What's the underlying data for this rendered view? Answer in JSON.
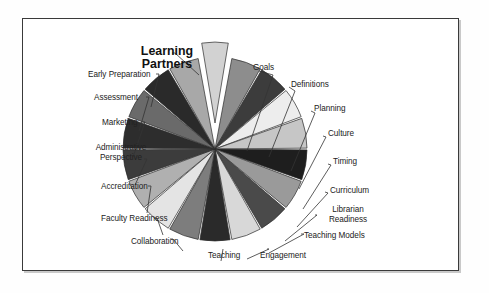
{
  "figure": {
    "title": "Learning Partners",
    "frame_border_color": "#3a3a3a",
    "background_color": "#ffffff"
  },
  "chart_data": {
    "type": "pie",
    "title": "Learning Partners",
    "xlabel": "",
    "ylabel": "",
    "grid": false,
    "legend": "none (direct labels with leader lines)",
    "note": "17 equal slices; the 'Learning Partners' slice is exploded away from the pie toward the upper-left.",
    "labels": [
      "Learning Partners",
      "Goals",
      "Definitions",
      "Planning",
      "Culture",
      "Timing",
      "Curriculum",
      "Librarian Readiness",
      "Teaching Models",
      "Engagement",
      "Teaching",
      "Collaboration",
      "Faculty Readiness",
      "Accreditation",
      "Administrative Perspective",
      "Marketing",
      "Assessment",
      "Early Preparation"
    ],
    "values": [
      1,
      1,
      1,
      1,
      1,
      1,
      1,
      1,
      1,
      1,
      1,
      1,
      1,
      1,
      1,
      1,
      1,
      1
    ],
    "slice_colors": [
      "#d2d2d2",
      "#8d8d8d",
      "#3c3c3c",
      "#ededed",
      "#c6c6c6",
      "#1e1e1e",
      "#9a9a9a",
      "#4a4a4a",
      "#d8d8d8",
      "#2a2a2a",
      "#7d7d7d",
      "#e4e4e4",
      "#b0b0b0",
      "#3c3c3c",
      "#2d2d2d",
      "#6a6a6a",
      "#2a2a2a",
      "#a8a8a8"
    ],
    "exploded_slice": "Learning Partners"
  },
  "labels": {
    "learning_partners": "Learning Partners",
    "goals": "Goals",
    "definitions": "Definitions",
    "planning": "Planning",
    "culture": "Culture",
    "timing": "Timing",
    "curriculum": "Curriculum",
    "librarian_readiness": "Librarian Readiness",
    "teaching_models": "Teaching Models",
    "engagement": "Engagement",
    "teaching": "Teaching",
    "collaboration": "Collaboration",
    "faculty_readiness": "Faculty Readiness",
    "accreditation": "Accreditation",
    "administrative_perspective": "Administrative Perspective",
    "marketing": "Marketing",
    "assessment": "Assessment",
    "early_preparation": "Early Preparation"
  }
}
